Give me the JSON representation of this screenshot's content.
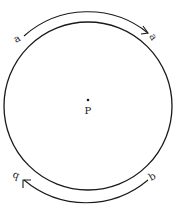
{
  "diagram": {
    "colors": {
      "stroke": "#1a1a1a",
      "background": "#ffffff"
    },
    "circle": {
      "cx": 88,
      "cy": 106,
      "r": 84
    },
    "center_point": {
      "label": "P",
      "x": 88,
      "y": 106
    },
    "top_arc": {
      "start_label": "a",
      "end_label": "a",
      "direction": "clockwise"
    },
    "bottom_arc": {
      "start_label": "b",
      "end_label": "b",
      "direction": "clockwise"
    }
  }
}
